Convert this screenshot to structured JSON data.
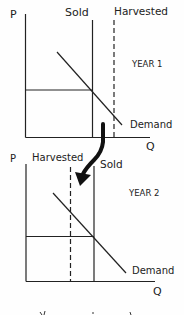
{
  "diagram": {
    "panels": [
      {
        "id": "year-1",
        "year_label": "YEAR 1",
        "axis_y_label": "P",
        "axis_x_label": "Q",
        "sold_label": "Sold",
        "harvested_label": "Harvested",
        "demand_label": "Demand",
        "sold_line_style": "solid",
        "harvested_line_style": "dashed",
        "harvested_relative_to_sold": "right"
      },
      {
        "id": "year-2",
        "year_label": "YEAR 2",
        "axis_y_label": "P",
        "axis_x_label": "Q",
        "sold_label": "Sold",
        "harvested_label": "Harvested",
        "demand_label": "Demand",
        "sold_line_style": "solid",
        "harvested_line_style": "dashed",
        "harvested_relative_to_sold": "left"
      }
    ],
    "transition_arrow": {
      "from": "year-1",
      "to": "year-2",
      "direction": "down"
    },
    "footer_partial_text": "..."
  },
  "colors": {
    "ink": "#222222",
    "background": "#fefefe"
  }
}
